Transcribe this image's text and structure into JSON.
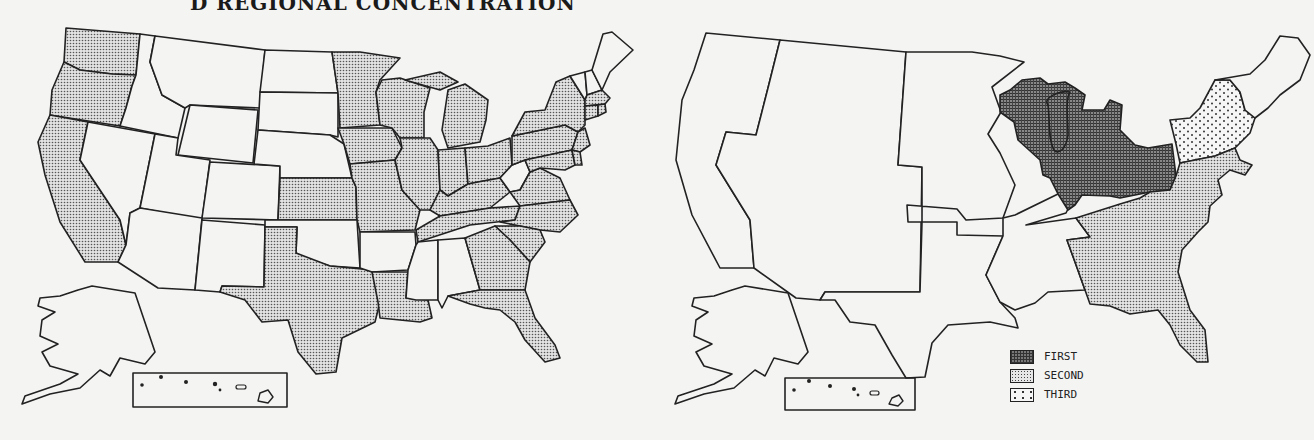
{
  "title": "D REGIONAL CONCENTRATION",
  "left_map": {
    "level": "state",
    "shaded_states": [
      "WA",
      "OR",
      "CA",
      "MN",
      "WI",
      "MI",
      "IA",
      "IL",
      "IN",
      "OH",
      "MO",
      "KS",
      "TX",
      "LA",
      "KY",
      "TN",
      "NC",
      "VA",
      "SC",
      "GA",
      "FL",
      "PA",
      "NY",
      "NJ",
      "MD",
      "DE",
      "MA",
      "CT",
      "RI"
    ],
    "unshaded_states": [
      "ID",
      "MT",
      "NV",
      "UT",
      "AZ",
      "WY",
      "CO",
      "NM",
      "ND",
      "SD",
      "NE",
      "OK",
      "AR",
      "MS",
      "AL",
      "WV",
      "ME",
      "VT",
      "NH",
      "AK",
      "HI"
    ]
  },
  "right_map": {
    "level": "region",
    "regions": [
      {
        "name": "East North Central",
        "rank": "FIRST"
      },
      {
        "name": "South Atlantic",
        "rank": "SECOND"
      },
      {
        "name": "Middle Atlantic",
        "rank": "THIRD"
      },
      {
        "name": "Pacific",
        "rank": ""
      },
      {
        "name": "Mountain",
        "rank": ""
      },
      {
        "name": "West North Central",
        "rank": ""
      },
      {
        "name": "West South Central",
        "rank": ""
      },
      {
        "name": "East South Central",
        "rank": ""
      },
      {
        "name": "New England",
        "rank": ""
      }
    ]
  },
  "legend": {
    "items": [
      {
        "label": "FIRST",
        "pattern": "dense-grid"
      },
      {
        "label": "SECOND",
        "pattern": "fine-dots"
      },
      {
        "label": "THIRD",
        "pattern": "sparse-dots"
      }
    ]
  }
}
